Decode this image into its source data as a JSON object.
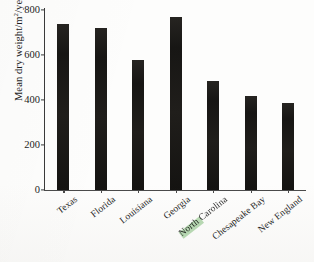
{
  "chart_data": {
    "type": "bar",
    "title": "",
    "xlabel": "",
    "ylabel": "Mean dry weight/m2/year",
    "ylabel_parts": {
      "prefix": "Mean dry weight/m",
      "superscript": "2",
      "suffix": "/year"
    },
    "categories": [
      "Texas",
      "Florida",
      "Louisiana",
      "Georgia",
      "North Carolina",
      "Chesapeake Bay",
      "New England"
    ],
    "values": [
      740,
      718,
      578,
      770,
      484,
      418,
      387
    ],
    "ylim": [
      0,
      800
    ],
    "yticks": [
      0,
      200,
      400,
      600,
      800
    ],
    "ytick_labels": [
      "0",
      "200",
      "400",
      "600",
      "800"
    ],
    "grid": false,
    "legend": null,
    "bar_color": "#1b1a18",
    "axis_color": "#3a3a3a",
    "text_color": "#1c1c1c",
    "annotations": [
      "green scan tint over North Carolina label"
    ]
  }
}
